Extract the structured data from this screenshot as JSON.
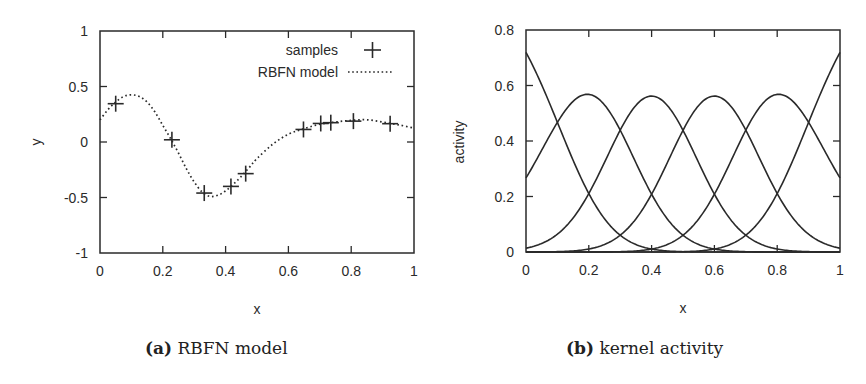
{
  "chart_data": [
    {
      "type": "scatter",
      "title": "RBFN model",
      "caption_tag": "(a)",
      "caption_text": "RBFN model",
      "xlabel": "x",
      "ylabel": "y",
      "xlim": [
        0,
        1
      ],
      "ylim": [
        -1,
        1
      ],
      "xticks": [
        "0",
        "0.2",
        "0.4",
        "0.6",
        "0.8",
        "1"
      ],
      "yticks": [
        "1",
        "0.5",
        "0",
        "-0.5",
        "-1"
      ],
      "grid": false,
      "legend_position": "upper right",
      "legend": [
        "samples",
        "RBFN model"
      ],
      "series": [
        {
          "name": "samples",
          "marker": "+",
          "x": [
            0.05,
            0.229,
            0.332,
            0.417,
            0.464,
            0.648,
            0.703,
            0.735,
            0.807,
            0.924
          ],
          "y": [
            0.345,
            0.02,
            -0.46,
            -0.4,
            -0.285,
            0.113,
            0.167,
            0.174,
            0.188,
            0.165
          ]
        },
        {
          "name": "RBFN model",
          "style": "dotted",
          "x": [
            0,
            0.025,
            0.05,
            0.075,
            0.1,
            0.125,
            0.15,
            0.175,
            0.2,
            0.225,
            0.25,
            0.275,
            0.3,
            0.325,
            0.35,
            0.375,
            0.4,
            0.425,
            0.45,
            0.475,
            0.5,
            0.55,
            0.6,
            0.65,
            0.7,
            0.75,
            0.8,
            0.85,
            0.9,
            0.95,
            1.0
          ],
          "y": [
            0.2,
            0.29,
            0.36,
            0.41,
            0.425,
            0.41,
            0.36,
            0.27,
            0.15,
            0.03,
            -0.1,
            -0.24,
            -0.36,
            -0.45,
            -0.49,
            -0.48,
            -0.44,
            -0.38,
            -0.31,
            -0.23,
            -0.15,
            -0.02,
            0.07,
            0.12,
            0.16,
            0.18,
            0.195,
            0.2,
            0.18,
            0.155,
            0.125
          ]
        }
      ]
    },
    {
      "type": "line",
      "title": "kernel activity",
      "caption_tag": "(b)",
      "caption_text": "kernel activity",
      "xlabel": "x",
      "ylabel": "activity",
      "xlim": [
        0,
        1
      ],
      "ylim": [
        0,
        0.8
      ],
      "xticks": [
        "0",
        "0.2",
        "0.4",
        "0.6",
        "0.8",
        "1"
      ],
      "yticks": [
        "0.8",
        "0.6",
        "0.4",
        "0.2",
        "0"
      ],
      "grid": false,
      "kernel_centers": [
        0,
        0.2,
        0.4,
        0.6,
        0.8,
        1.0
      ],
      "kernel_sigma": 0.142,
      "normalized": true,
      "peak_values": {
        "0": 0.72,
        "0.2": 0.57,
        "0.4": 0.565,
        "0.6": 0.565,
        "0.8": 0.57,
        "1": 0.72
      }
    }
  ]
}
